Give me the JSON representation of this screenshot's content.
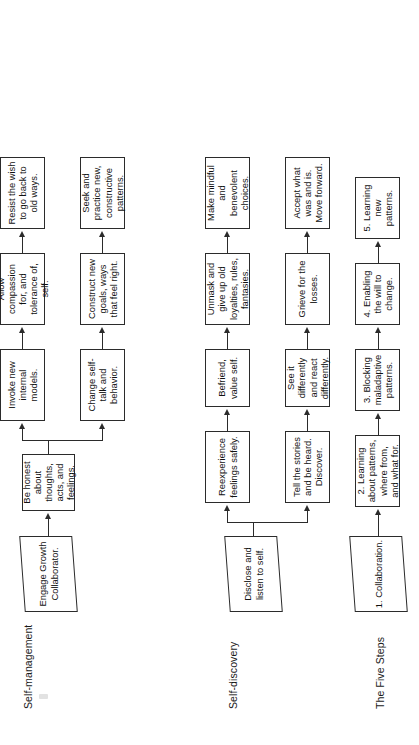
{
  "document": {
    "title": "Change process flowchart",
    "orientation": "landscape content rotated 90 degrees counter-clockwise",
    "ink_color": "#2b2b2b",
    "text_color": "#111111",
    "background": "#ffffff"
  },
  "sections": [
    {
      "id": "self-management",
      "label": "Self-management",
      "start": {
        "shape": "parallelogram",
        "text": "Engage Growth Collaborator."
      },
      "stem": {
        "shape": "rectangle",
        "text": "Be honest about thoughts, acts, and feelings."
      },
      "branches": [
        {
          "id": "upper",
          "nodes": [
            {
              "shape": "rectangle",
              "text": "Invoke new internal models."
            },
            {
              "shape": "rectangle",
              "text": "Allow compassion for, and tolerance of, self."
            },
            {
              "shape": "rectangle",
              "text": "Resist the wish to go back to old ways."
            }
          ]
        },
        {
          "id": "lower",
          "nodes": [
            {
              "shape": "rectangle",
              "text": "Change self-talk and behavior."
            },
            {
              "shape": "rectangle",
              "text": "Construct new goals, ways that feel right."
            },
            {
              "shape": "rectangle",
              "text": "Seek and practice new, constructive patterns."
            }
          ]
        }
      ]
    },
    {
      "id": "self-discovery",
      "label": "Self-discovery",
      "start": {
        "shape": "parallelogram",
        "text": "Disclose and listen to self."
      },
      "stem": null,
      "branches": [
        {
          "id": "upper",
          "nodes": [
            {
              "shape": "rectangle",
              "text": "Reexperience feelings safely."
            },
            {
              "shape": "rectangle",
              "text": "Befriend, value self."
            },
            {
              "shape": "rectangle",
              "text": "Unmask and give up old loyalties, rules, fantasies."
            },
            {
              "shape": "rectangle",
              "text": "Make mindful and benevolent choices."
            }
          ]
        },
        {
          "id": "lower",
          "nodes": [
            {
              "shape": "rectangle",
              "text": "Tell the stories and be heard. Discover."
            },
            {
              "shape": "rectangle",
              "text": "See it differently and react differently."
            },
            {
              "shape": "rectangle",
              "text": "Grieve for the losses."
            },
            {
              "shape": "rectangle",
              "text": "Accept what was and is. Move forward."
            }
          ]
        }
      ]
    },
    {
      "id": "the-five-steps",
      "label": "The Five Steps",
      "start": {
        "shape": "parallelogram",
        "text": "1. Collaboration."
      },
      "stem": null,
      "branches": [
        {
          "id": "single",
          "nodes": [
            {
              "shape": "rectangle",
              "text": "2. Learning about patterns, where from, and what for."
            },
            {
              "shape": "rectangle",
              "text": "3. Blocking maladaptive patterns."
            },
            {
              "shape": "rectangle",
              "text": "4. Enabling the will to change."
            },
            {
              "shape": "rectangle",
              "text": "5. Learning new patterns."
            }
          ]
        }
      ]
    }
  ]
}
